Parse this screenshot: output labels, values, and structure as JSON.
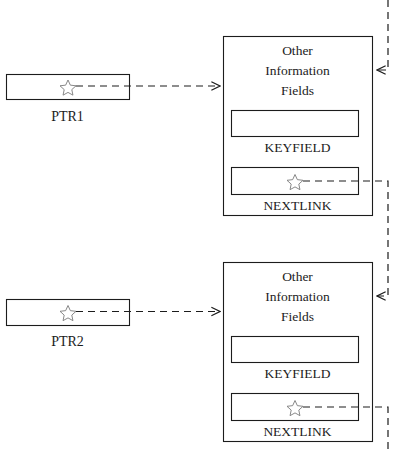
{
  "diagram": {
    "stroke_color": "#1c1c1c",
    "background_color": "#ffffff",
    "pointer_marker": "star-glyph",
    "pointer_boxes": [
      {
        "label": "PTR1"
      },
      {
        "label": "PTR2"
      }
    ],
    "records": [
      {
        "other_info_lines": [
          "Other",
          "Information",
          "Fields"
        ],
        "keyfield_label": "KEYFIELD",
        "nextlink_label": "NEXTLINK"
      },
      {
        "other_info_lines": [
          "Other",
          "Information",
          "Fields"
        ],
        "keyfield_label": "KEYFIELD",
        "nextlink_label": "NEXTLINK"
      }
    ]
  }
}
